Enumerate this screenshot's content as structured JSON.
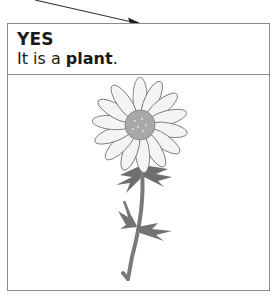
{
  "card": {
    "title": "YES",
    "subtitle_prefix": "It is a ",
    "subtitle_bold": "plant",
    "subtitle_suffix": "."
  },
  "illustration": {
    "subject": "daisy-flower",
    "colors": {
      "petal": "#f4f4f4",
      "petal_outline": "#6a6a6a",
      "center": "#a9a9a9",
      "stem": "#7a7a7a",
      "leaf": "#6e6e6e"
    }
  },
  "colors": {
    "border": "#8a8a8a",
    "text": "#1a1a1a",
    "arrow": "#333333"
  }
}
